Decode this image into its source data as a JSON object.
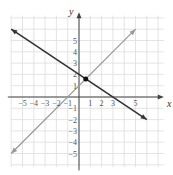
{
  "chart_data": {
    "type": "line",
    "title": "",
    "xlabel": "x",
    "ylabel": "y",
    "xlim": [
      -6,
      7
    ],
    "ylim": [
      -6,
      7
    ],
    "grid": true,
    "x_ticks": [
      "-5",
      "-4",
      "-3",
      "-2",
      "-1",
      "1",
      "2",
      "3",
      "5"
    ],
    "y_ticks": [
      "5",
      "4",
      "3",
      "2",
      "1",
      "-1",
      "-2",
      "-3",
      "-4",
      "-5"
    ],
    "series": [
      {
        "name": "y = -2/3 x + 2",
        "color": "#333333",
        "x": [
          -6,
          6
        ],
        "y": [
          6,
          -2
        ]
      },
      {
        "name": "y = x + 1",
        "color": "#999999",
        "x": [
          -6,
          5
        ],
        "y": [
          -5,
          6
        ]
      }
    ],
    "annotations": [
      {
        "type": "point",
        "x": 0.6,
        "y": 1.6
      }
    ]
  }
}
